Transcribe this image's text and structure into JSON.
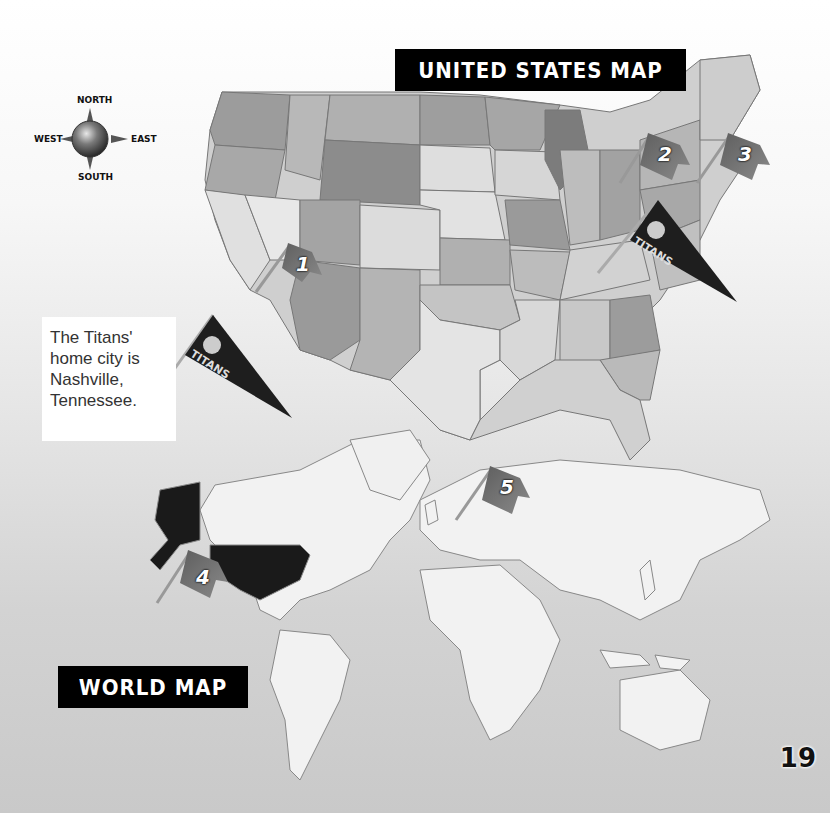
{
  "us_map": {
    "title": "United States Map",
    "flags": [
      {
        "number": "1",
        "label": "Flag 1"
      },
      {
        "number": "2",
        "label": "Flag 2"
      },
      {
        "number": "3",
        "label": "Flag 3"
      }
    ]
  },
  "world_map": {
    "title": "World Map",
    "flags": [
      {
        "number": "4",
        "label": "Flag 4"
      },
      {
        "number": "5",
        "label": "Flag 5"
      }
    ]
  },
  "compass": {
    "north": "NORTH",
    "south": "SOUTH",
    "east": "EAST",
    "west": "WEST"
  },
  "callout": {
    "text": "The Titans' home city is Nashville, Tennessee."
  },
  "pennant": {
    "team": "TITANS"
  },
  "page_number": "19",
  "colors": {
    "title_bar_bg": "#000000",
    "title_bar_text": "#ffffff",
    "highlight_region": "#1a1a1a",
    "land": "#f2f2f2",
    "flag": "#6e6e6e"
  }
}
